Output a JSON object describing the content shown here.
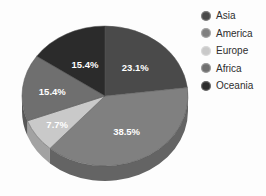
{
  "chart_data": {
    "type": "pie",
    "title": "",
    "subtitle": "",
    "xlabel": "",
    "ylabel": "",
    "grid": false,
    "legend_position": "right",
    "three_d": true,
    "start_angle_deg": 0,
    "direction": "clockwise",
    "categories": [
      "Asia",
      "America",
      "Europe",
      "Africa",
      "Oceania"
    ],
    "values": [
      23.1,
      38.5,
      7.7,
      15.4,
      15.4
    ],
    "labels": [
      "23.1%",
      "38.5%",
      "7.7%",
      "15.4%",
      "15.4%"
    ],
    "colors": [
      "#4a4a4a",
      "#808080",
      "#c9c9c9",
      "#6f6f6f",
      "#2b2b2b"
    ],
    "slices": [
      {
        "name": "Asia",
        "value": 23.1,
        "label": "23.1%",
        "color": "#4a4a4a",
        "side_color": "#3b3b3b"
      },
      {
        "name": "America",
        "value": 38.5,
        "label": "38.5%",
        "color": "#808080",
        "side_color": "#646464"
      },
      {
        "name": "Europe",
        "value": 7.7,
        "label": "7.7%",
        "color": "#c9c9c9",
        "side_color": "#a2a2a2"
      },
      {
        "name": "Africa",
        "value": 15.4,
        "label": "15.4%",
        "color": "#6f6f6f",
        "side_color": "#585858"
      },
      {
        "name": "Oceania",
        "value": 15.4,
        "label": "15.4%",
        "color": "#2b2b2b",
        "side_color": "#1f1f1f"
      }
    ]
  },
  "legend": {
    "items": [
      {
        "label": "Asia",
        "color": "#4a4a4a"
      },
      {
        "label": "America",
        "color": "#808080"
      },
      {
        "label": "Europe",
        "color": "#c9c9c9"
      },
      {
        "label": "Africa",
        "color": "#6f6f6f"
      },
      {
        "label": "Oceania",
        "color": "#2b2b2b"
      }
    ]
  },
  "labels": {
    "asia_pct": "23.1%",
    "america_pct": "38.5%",
    "europe_pct": "7.7%",
    "africa_pct": "15.4%",
    "oceania_pct": "15.4%"
  }
}
